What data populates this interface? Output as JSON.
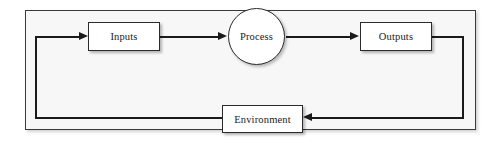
{
  "diagram": {
    "boundary_label": "",
    "nodes": [
      {
        "id": "inputs",
        "label": "Inputs",
        "shape": "rectangle"
      },
      {
        "id": "process",
        "label": "Process",
        "shape": "circle"
      },
      {
        "id": "outputs",
        "label": "Outputs",
        "shape": "rectangle"
      },
      {
        "id": "environment",
        "label": "Environment",
        "shape": "rectangle"
      }
    ],
    "edges": [
      {
        "from": "feedback",
        "to": "inputs",
        "direction": "right",
        "arrow": true
      },
      {
        "from": "inputs",
        "to": "process",
        "direction": "right",
        "arrow": true
      },
      {
        "from": "process",
        "to": "outputs",
        "direction": "right",
        "arrow": true
      },
      {
        "from": "outputs",
        "to": "environment",
        "direction": "left",
        "arrow": true
      },
      {
        "from": "environment",
        "to": "inputs",
        "direction": "loop",
        "arrow": false
      }
    ],
    "colors": {
      "line": "#1a1a1a",
      "node_border": "#2b2b2b",
      "node_fill": "#ffffff",
      "frame_border": "#3a3a3a",
      "frame_fill": "#f7f7f7",
      "page_background": "#ffffff",
      "text": "#1a1a1a"
    }
  }
}
